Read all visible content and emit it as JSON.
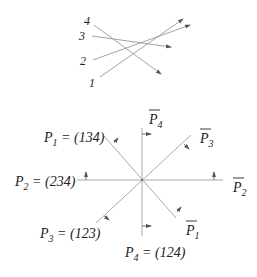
{
  "top_diagram": {
    "lines": [
      {
        "label": "4",
        "x1": 94,
        "y1": 25,
        "x2": 161,
        "y2": 74
      },
      {
        "label": "3",
        "x1": 92,
        "y1": 36,
        "x2": 171,
        "y2": 47
      },
      {
        "label": "2",
        "x1": 93,
        "y1": 60,
        "x2": 190,
        "y2": 25
      },
      {
        "label": "1",
        "x1": 100,
        "y1": 77,
        "x2": 183,
        "y2": 19
      }
    ],
    "labels": {
      "l4": "4",
      "l3": "3",
      "l2": "2",
      "l1": "1"
    }
  },
  "bottom_diagram": {
    "center": [
      142,
      180
    ],
    "labels": {
      "p1": "P",
      "p1_sub": "1",
      "p1_val": " = (134)",
      "p2": "P",
      "p2_sub": "2",
      "p2_val": " = (234)",
      "p3": "P",
      "p3_sub": "3",
      "p3_val": " = (123)",
      "p4": "P",
      "p4_sub": "4",
      "p4_val": " = (124)",
      "p1_bar": "P",
      "p1_bar_sub": "1",
      "p2_bar": "P",
      "p2_bar_sub": "2",
      "p3_bar": "P",
      "p3_bar_sub": "3",
      "p4_bar": "P",
      "p4_bar_sub": "4"
    }
  },
  "colors": {
    "line": "#aaaaaa",
    "text": "#222222",
    "arrow": "#555555"
  }
}
